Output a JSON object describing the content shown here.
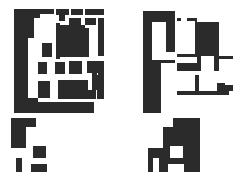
{
  "figure": {
    "canvas": {
      "width": 248,
      "height": 182
    },
    "background_color": "#ffffff",
    "ink_color": "#2b2b2b",
    "layout": "2x2 grid of abstract rectilinear binary patterns; right column is the tonal inverse of the left column",
    "panel_count": 4
  },
  "panels": [
    {
      "id": "panel-top-left",
      "name": "top-left-pattern",
      "polarity": "black-on-white",
      "bounds": {
        "x": 14,
        "y": 9,
        "width": 90,
        "height": 104
      },
      "viewbox": "0 0 90 104",
      "shapes": [
        {
          "x": 0,
          "y": 0,
          "w": 14,
          "h": 104
        },
        {
          "x": 14,
          "y": 0,
          "w": 12,
          "h": 9
        },
        {
          "x": 26,
          "y": 0,
          "w": 14,
          "h": 5
        },
        {
          "x": 42,
          "y": 0,
          "w": 13,
          "h": 6
        },
        {
          "x": 57,
          "y": 0,
          "w": 12,
          "h": 6
        },
        {
          "x": 71,
          "y": 0,
          "w": 19,
          "h": 6
        },
        {
          "x": 14,
          "y": 9,
          "w": 6,
          "h": 20
        },
        {
          "x": 45,
          "y": 2,
          "w": 6,
          "h": 10
        },
        {
          "x": 55,
          "y": 9,
          "w": 12,
          "h": 7
        },
        {
          "x": 71,
          "y": 9,
          "w": 11,
          "h": 7
        },
        {
          "x": 84,
          "y": 9,
          "w": 6,
          "h": 38
        },
        {
          "x": 42,
          "y": 14,
          "w": 4,
          "h": 36
        },
        {
          "x": 46,
          "y": 16,
          "w": 25,
          "h": 32
        },
        {
          "x": 71,
          "y": 19,
          "w": 4,
          "h": 29
        },
        {
          "x": 28,
          "y": 34,
          "w": 10,
          "h": 14
        },
        {
          "x": 14,
          "y": 50,
          "w": 0,
          "h": 0
        },
        {
          "x": 24,
          "y": 53,
          "w": 9,
          "h": 12
        },
        {
          "x": 41,
          "y": 53,
          "w": 10,
          "h": 12
        },
        {
          "x": 55,
          "y": 52,
          "w": 13,
          "h": 13
        },
        {
          "x": 73,
          "y": 52,
          "w": 11,
          "h": 12
        },
        {
          "x": 84,
          "y": 52,
          "w": 6,
          "h": 14
        },
        {
          "x": 24,
          "y": 72,
          "w": 12,
          "h": 17
        },
        {
          "x": 44,
          "y": 71,
          "w": 30,
          "h": 10
        },
        {
          "x": 44,
          "y": 81,
          "w": 38,
          "h": 9
        },
        {
          "x": 78,
          "y": 64,
          "w": 5,
          "h": 10
        },
        {
          "x": 78,
          "y": 74,
          "w": 12,
          "h": 7
        },
        {
          "x": 83,
          "y": 66,
          "w": 7,
          "h": 24
        },
        {
          "x": 14,
          "y": 93,
          "w": 66,
          "h": 11
        },
        {
          "x": 14,
          "y": 89,
          "w": 10,
          "h": 15
        }
      ]
    },
    {
      "id": "panel-top-right",
      "name": "top-right-pattern-inverse",
      "polarity": "white-on-black",
      "bounds": {
        "x": 139,
        "y": 9,
        "width": 94,
        "height": 104
      },
      "viewbox": "0 0 94 104",
      "base_fill": "#ffffff",
      "shapes": [
        {
          "x": 0,
          "y": 0,
          "w": 4,
          "h": 104
        },
        {
          "x": 4,
          "y": 0,
          "w": 34,
          "h": 2
        },
        {
          "x": 36,
          "y": 0,
          "w": 2,
          "h": 104
        },
        {
          "x": 13,
          "y": 13,
          "w": 14,
          "h": 38
        },
        {
          "x": 22,
          "y": 43,
          "w": 16,
          "h": 8
        },
        {
          "x": 38,
          "y": 0,
          "w": 18,
          "h": 9
        },
        {
          "x": 56,
          "y": 0,
          "w": 5,
          "h": 9
        },
        {
          "x": 61,
          "y": 0,
          "w": 33,
          "h": 9
        },
        {
          "x": 42,
          "y": 9,
          "w": 6,
          "h": 3
        },
        {
          "x": 38,
          "y": 12,
          "w": 18,
          "h": 33
        },
        {
          "x": 58,
          "y": 9,
          "w": 36,
          "h": 4
        },
        {
          "x": 80,
          "y": 13,
          "w": 14,
          "h": 34
        },
        {
          "x": 38,
          "y": 48,
          "w": 20,
          "h": 6
        },
        {
          "x": 62,
          "y": 47,
          "w": 13,
          "h": 15
        },
        {
          "x": 80,
          "y": 50,
          "w": 14,
          "h": 12
        },
        {
          "x": 38,
          "y": 62,
          "w": 56,
          "h": 4
        },
        {
          "x": 38,
          "y": 66,
          "w": 18,
          "h": 16
        },
        {
          "x": 60,
          "y": 66,
          "w": 26,
          "h": 8
        },
        {
          "x": 60,
          "y": 74,
          "w": 18,
          "h": 8
        },
        {
          "x": 86,
          "y": 66,
          "w": 8,
          "h": 10
        },
        {
          "x": 38,
          "y": 86,
          "w": 52,
          "h": 18
        },
        {
          "x": 90,
          "y": 82,
          "w": 4,
          "h": 22
        },
        {
          "x": 22,
          "y": 54,
          "w": 16,
          "h": 50
        }
      ]
    },
    {
      "id": "panel-bottom-left",
      "name": "bottom-left-pattern",
      "polarity": "black-on-white",
      "bounds": {
        "x": 11,
        "y": 118,
        "width": 52,
        "height": 54
      },
      "viewbox": "0 0 52 54",
      "shapes": [
        {
          "x": 0,
          "y": 0,
          "w": 15,
          "h": 30
        },
        {
          "x": 15,
          "y": 0,
          "w": 10,
          "h": 9
        },
        {
          "x": 22,
          "y": 28,
          "w": 13,
          "h": 12
        },
        {
          "x": 5,
          "y": 40,
          "w": 6,
          "h": 14
        },
        {
          "x": 20,
          "y": 46,
          "w": 16,
          "h": 8
        }
      ]
    },
    {
      "id": "panel-bottom-right",
      "name": "bottom-right-pattern-inverse",
      "polarity": "white-on-black",
      "bounds": {
        "x": 148,
        "y": 118,
        "width": 52,
        "height": 54
      },
      "viewbox": "0 0 52 54",
      "base_fill": "#ffffff",
      "shapes": [
        {
          "x": 0,
          "y": 0,
          "w": 15,
          "h": 30
        },
        {
          "x": 15,
          "y": 0,
          "w": 10,
          "h": 9
        },
        {
          "x": 22,
          "y": 28,
          "w": 13,
          "h": 12
        },
        {
          "x": 5,
          "y": 40,
          "w": 6,
          "h": 14
        },
        {
          "x": 20,
          "y": 46,
          "w": 16,
          "h": 8
        }
      ]
    }
  ]
}
